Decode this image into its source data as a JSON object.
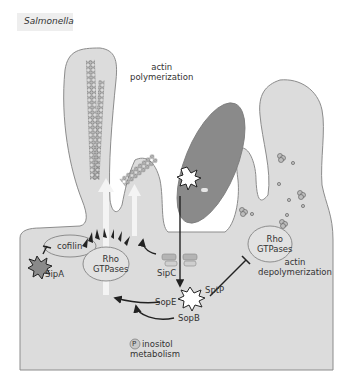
{
  "title": "Salmonella",
  "labels": {
    "actin_polymerization": [
      "actin",
      "polymerization"
    ],
    "cofilin": "cofilin",
    "rho_gtpases_left": [
      "Rho",
      "GTPases"
    ],
    "rho_gtpases_right": [
      "Rho",
      "GTPases"
    ],
    "actin_depolymerization": [
      "actin",
      "depolymerization"
    ],
    "sipA": "SipA",
    "sipC": "SipC",
    "sptP": "SptP",
    "sopE": "SopE",
    "sopB": "SopB",
    "phospho_symbol": "P",
    "inositol_metabolism": [
      "inositol",
      "metabolism"
    ]
  },
  "colors": {
    "cell_fill": "#dcdcdc",
    "cell_stroke": "#8c8c8c",
    "bacterium_fill": "#8a8a8a",
    "actin_filament": "#6e6e6e",
    "arrow": "#222222",
    "upward_arrow": "#f4f4f4",
    "text": "#333333"
  }
}
